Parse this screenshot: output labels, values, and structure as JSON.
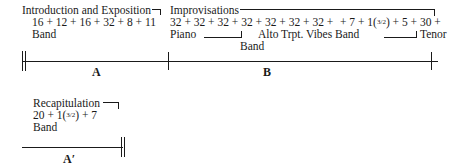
{
  "sections": {
    "intro": {
      "title": "Introduction and Exposition",
      "measures": "16 + 12 + 16 + 32 + 8 + 11",
      "instrument": "Band",
      "label": "A"
    },
    "improv": {
      "title": "Improvisations",
      "measures_1": "32 + 32 + 32 + 32 + 32 + 32 + 32 +",
      "measures_2_pre": "+ 7 + 1(",
      "measures_2_frac": "3/2",
      "measures_2_post": ") + 5 + 30 +",
      "soloist_piano": "Piano",
      "soloists_mid": "Alto Trpt. Vibes Band",
      "soloist_tenor": "Tenor",
      "band_label": "Band",
      "label": "B"
    },
    "recap": {
      "title": "Recapitulation",
      "measures_pre": "20 + 1(",
      "measures_frac": "3/2",
      "measures_post": ") + 7",
      "instrument": "Band",
      "label": "A′"
    }
  },
  "colors": {
    "ink": "#1a1a1a",
    "background": "#ffffff"
  }
}
